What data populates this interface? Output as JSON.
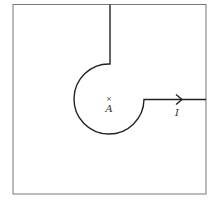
{
  "diagram": {
    "type": "contour",
    "point_label": "A",
    "point_marker": "×",
    "path_label": "I",
    "colors": {
      "stroke": "#222222",
      "frame": "#777777",
      "background": "#ffffff"
    }
  }
}
